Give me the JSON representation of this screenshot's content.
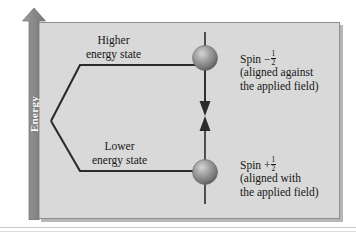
{
  "figure": {
    "type": "energy-level-splitting-diagram",
    "axis": {
      "label": "Energy",
      "direction": "up",
      "arrow_color": "#8f8f8f",
      "label_color": "#ffffff"
    },
    "panel": {
      "background_color": "#d9d9d9",
      "border_color": "#8e8e8e"
    },
    "levels": [
      {
        "id": "upper",
        "label_line1": "Higher",
        "label_line2": "energy state",
        "spin_label_prefix": "Spin",
        "spin_sign": "−",
        "spin_numerator": "1",
        "spin_denominator": "2",
        "description_line1": "(aligned against",
        "description_line2": "the applied field)",
        "arrow_direction": "down"
      },
      {
        "id": "lower",
        "label_line1": "Lower",
        "label_line2": "energy state",
        "spin_label_prefix": "Spin",
        "spin_sign": "+",
        "spin_numerator": "1",
        "spin_denominator": "2",
        "description_line1": "(aligned with",
        "description_line2": "the applied field)",
        "arrow_direction": "up"
      }
    ],
    "colors": {
      "line": "#2b2b2b",
      "sphere_light": "#cfcfcf",
      "sphere_mid": "#9a9a9a",
      "sphere_dark": "#5f5f5f",
      "text": "#161616"
    }
  }
}
